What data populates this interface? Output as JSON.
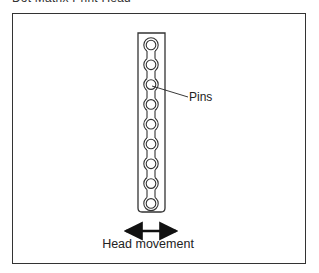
{
  "heading": "Dot Matrix Print Head",
  "diagram": {
    "print_head": {
      "pin_count": 9,
      "label": "Pins"
    },
    "movement_label": "Head movement",
    "colors": {
      "line": "#333333",
      "background": "#ffffff"
    }
  }
}
